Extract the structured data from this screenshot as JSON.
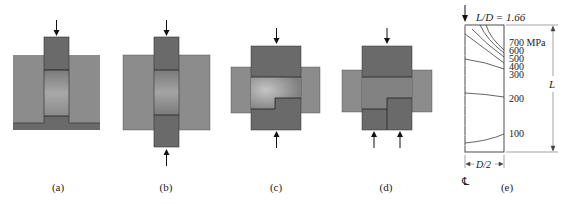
{
  "figure": {
    "panels": [
      {
        "id": "a",
        "caption": "(a)",
        "description": "Punch pressing into billet inside closed die"
      },
      {
        "id": "b",
        "caption": "(b)",
        "description": "Billet compressed by upper and lower punches in die"
      },
      {
        "id": "c",
        "caption": "(c)",
        "description": "Stepped part compressed between upper and lower punches"
      },
      {
        "id": "d",
        "caption": "(d)",
        "description": "Stepped part with upper punch and two lower punches"
      },
      {
        "id": "e",
        "caption": "(e)",
        "description": "Pressure contours in compact"
      }
    ],
    "contour_plot": {
      "ratio_label": "L/D = 1.66",
      "contour_labels": [
        "700 MPa",
        "600",
        "500",
        "400",
        "300",
        "200",
        "100"
      ],
      "length_label": "L",
      "width_label": "D/2",
      "centerline_symbol": "℄"
    },
    "colors": {
      "die": "#8c8c8c",
      "punch": "#6a6a6a",
      "powder_light": "#b8b8b8",
      "outline": "#222222"
    }
  }
}
